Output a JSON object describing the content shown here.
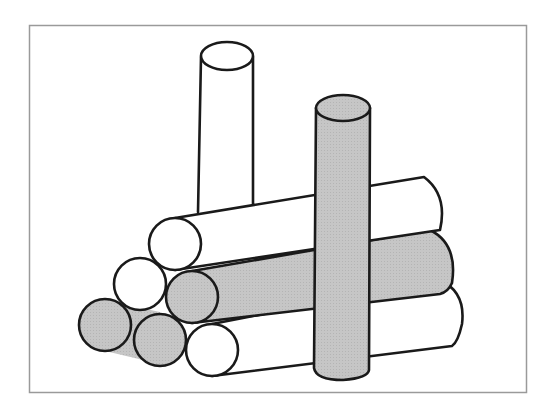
{
  "figure": {
    "colors": {
      "background": "#ffffff",
      "frame": "#9a9a9a",
      "outline": "#1a1a1a",
      "white_fill": "#ffffff",
      "gray_fill": "#c4c4c4"
    },
    "upright_cylinders": [
      {
        "name": "tall-white-cylinder",
        "fill": "white"
      },
      {
        "name": "gray-front-cylinder",
        "fill": "gray"
      }
    ],
    "horizontal_logs": [
      {
        "name": "top-log",
        "fill": "white",
        "row": 1
      },
      {
        "name": "middle-left-log",
        "fill": "white",
        "row": 2
      },
      {
        "name": "middle-gray-log",
        "fill": "gray",
        "row": 2
      },
      {
        "name": "bottom-left-log",
        "fill": "gray",
        "row": 3
      },
      {
        "name": "bottom-middle-log",
        "fill": "gray",
        "row": 3
      },
      {
        "name": "bottom-right-log",
        "fill": "white",
        "row": 3
      }
    ]
  }
}
